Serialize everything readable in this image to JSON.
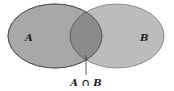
{
  "diagram": {
    "type": "venn",
    "sets": [
      {
        "label": "A",
        "fill": "#a8a8a8"
      },
      {
        "label": "B",
        "fill": "#bcbcbc"
      }
    ],
    "intersection": {
      "label": "A ∩ B",
      "fill": "#8a8a8a"
    },
    "stroke": "#5a5a5a"
  }
}
